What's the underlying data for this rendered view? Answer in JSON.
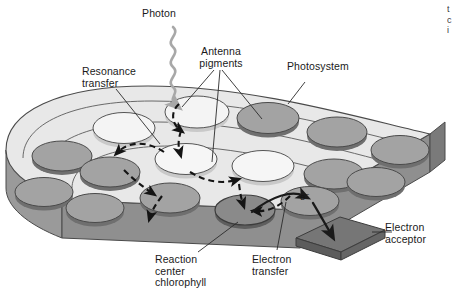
{
  "figure": {
    "type": "biology-schematic",
    "background_color": "#ffffff"
  },
  "labels": {
    "photon": "Photon",
    "resonance_transfer": "Resonance\ntransfer",
    "antenna_pigments": "Antenna\npigments",
    "photosystem": "Photosystem",
    "reaction_center_chlorophyll": "Reaction\ncenter\nchlorophyll",
    "electron_transfer": "Electron\ntransfer",
    "electron_acceptor": "Electron\nacceptor",
    "electron_symbol": "e",
    "electron_charge": "–"
  },
  "edge_text": {
    "lines": [
      "t",
      "c",
      "i"
    ]
  },
  "colors": {
    "membrane_top": "#e8e8e8",
    "membrane_top_light": "#efefef",
    "membrane_side": "#8f8f8f",
    "membrane_side_dark": "#7a7a7a",
    "disc_light": "#f2f2f2",
    "disc_light_edge": "#c9c9c9",
    "disc_dark": "#a0a0a0",
    "disc_dark_edge": "#6f6f6f",
    "reaction_center": "#8a8a8a",
    "acceptor": "#777777",
    "acceptor_side": "#5f5f5f",
    "outline": "#4a4a4a",
    "photon_arrow": "#a8a8a8",
    "dashed_arrow": "#141414",
    "leader_line": "#2a2a2a",
    "text": "#1a1a1a"
  },
  "elements": {
    "photon_arrow": {
      "name": "wavy-photon-arrow",
      "description": "wavy grey arrow descending to antenna pigment disc"
    },
    "resonance_arrows": {
      "name": "dashed-resonance-arrows",
      "count": 7,
      "style": "dashed black arrows between discs"
    },
    "electron_transfer_arrow": {
      "name": "curved-electron-arrow",
      "description": "solid curved arrow from reaction center to e-"
    },
    "acceptor_arrow": {
      "name": "acceptor-arrow",
      "description": "solid arrow from e- into electron acceptor plate"
    },
    "discs": {
      "light_count": 9,
      "dark_count": 11,
      "reaction_center_count": 1
    }
  }
}
